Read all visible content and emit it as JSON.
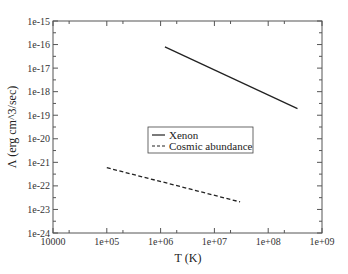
{
  "chart_data": {
    "type": "line",
    "title": "",
    "xlabel": "T (K)",
    "ylabel": "Λ (erg cm^3/sec)",
    "xscale": "log",
    "yscale": "log",
    "xlim": [
      10000,
      1000000000
    ],
    "ylim": [
      1e-24,
      1e-15
    ],
    "x_ticks": [
      "10000",
      "1e+05",
      "1e+06",
      "1e+07",
      "1e+08",
      "1e+09"
    ],
    "y_ticks": [
      "1e-15",
      "1e-16",
      "1e-17",
      "1e-18",
      "1e-19",
      "1e-20",
      "1e-21",
      "1e-22",
      "1e-23",
      "1e-24"
    ],
    "grid": false,
    "legend_position": "center (inside plot)",
    "series": [
      {
        "name": "Xenon",
        "style": "solid",
        "color": "#222222",
        "x": [
          1200000,
          350000000
        ],
        "y": [
          8e-17,
          1.9e-19
        ]
      },
      {
        "name": "Cosmic abundance",
        "style": "dashed",
        "color": "#222222",
        "x": [
          100000,
          30000000
        ],
        "y": [
          5.9e-22,
          2.1e-23
        ]
      }
    ]
  }
}
